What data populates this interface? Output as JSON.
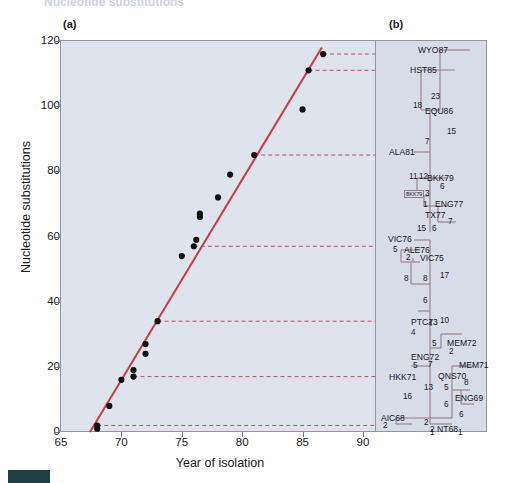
{
  "figure": {
    "running_head": "Nucleotide substitutions",
    "panel_a_tag": "(a)",
    "panel_b_tag": "(b)"
  },
  "chart_data": {
    "type": "scatter",
    "title": "",
    "xlabel": "Year of isolation",
    "ylabel": "Nucleotide substitutions",
    "xlim": [
      65,
      91
    ],
    "ylim": [
      0,
      120
    ],
    "xticks": [
      65,
      70,
      75,
      80,
      85,
      90
    ],
    "yticks": [
      0,
      20,
      40,
      60,
      80,
      100,
      120
    ],
    "grid": false,
    "legend": "none",
    "series": [
      {
        "name": "Influenza isolates",
        "points": [
          {
            "x": 68.0,
            "y": 1
          },
          {
            "x": 68.0,
            "y": 2
          },
          {
            "x": 69.0,
            "y": 8
          },
          {
            "x": 70.0,
            "y": 16
          },
          {
            "x": 71.0,
            "y": 17
          },
          {
            "x": 71.0,
            "y": 19
          },
          {
            "x": 72.0,
            "y": 24
          },
          {
            "x": 72.0,
            "y": 27
          },
          {
            "x": 73.0,
            "y": 34
          },
          {
            "x": 75.0,
            "y": 54
          },
          {
            "x": 76.0,
            "y": 57
          },
          {
            "x": 76.2,
            "y": 59
          },
          {
            "x": 76.5,
            "y": 66
          },
          {
            "x": 76.5,
            "y": 67
          },
          {
            "x": 78.0,
            "y": 72
          },
          {
            "x": 79.0,
            "y": 79
          },
          {
            "x": 81.0,
            "y": 85
          },
          {
            "x": 85.0,
            "y": 99
          },
          {
            "x": 85.5,
            "y": 111
          },
          {
            "x": 86.7,
            "y": 116
          }
        ]
      }
    ],
    "regression_line": {
      "x1": 67.4,
      "y1": 0,
      "x2": 86.6,
      "y2": 118,
      "color": "#c43c46"
    },
    "dashed_links": [
      {
        "y": 116,
        "from_x": 86.7,
        "to_x": 91,
        "label": "WYO87"
      },
      {
        "y": 111,
        "from_x": 85.5,
        "to_x": 91,
        "label": "HST85"
      },
      {
        "y": 85,
        "from_x": 81.0,
        "to_x": 91,
        "label": "ALA81"
      },
      {
        "y": 57,
        "from_x": 76.0,
        "to_x": 91,
        "label": "VIC76"
      },
      {
        "y": 34,
        "from_x": 73.0,
        "to_x": 91,
        "label": "PTC73"
      },
      {
        "y": 17,
        "from_x": 71.0,
        "to_x": 91,
        "label": "HKK71"
      },
      {
        "y": 2,
        "from_x": 68.0,
        "to_x": 91,
        "label": "AIC68"
      }
    ]
  },
  "tree": {
    "taxa": [
      {
        "name": "WYO87",
        "x": 418,
        "y": 45,
        "boxed": false
      },
      {
        "name": "HST85",
        "x": 410,
        "y": 65,
        "boxed": false
      },
      {
        "name": "EQU86",
        "x": 425,
        "y": 106,
        "boxed": false
      },
      {
        "name": "ALA81",
        "x": 389,
        "y": 147,
        "boxed": false
      },
      {
        "name": "BKK79",
        "x": 427,
        "y": 173,
        "boxed": false
      },
      {
        "name": "BKK79",
        "x": 404,
        "y": 190,
        "boxed": true
      },
      {
        "name": "ENG77",
        "x": 435,
        "y": 199,
        "boxed": false
      },
      {
        "name": "TX77",
        "x": 425,
        "y": 210,
        "boxed": false
      },
      {
        "name": "VIC76",
        "x": 388,
        "y": 234,
        "boxed": false
      },
      {
        "name": "ALE76",
        "x": 404,
        "y": 245,
        "boxed": false
      },
      {
        "name": "VIC75",
        "x": 420,
        "y": 253,
        "boxed": false
      },
      {
        "name": "PTC73",
        "x": 411,
        "y": 317,
        "boxed": false
      },
      {
        "name": "MEM72",
        "x": 447,
        "y": 338,
        "boxed": false
      },
      {
        "name": "ENG72",
        "x": 411,
        "y": 352,
        "boxed": false
      },
      {
        "name": "MEM71",
        "x": 459,
        "y": 360,
        "boxed": false
      },
      {
        "name": "HKK71",
        "x": 389,
        "y": 372,
        "boxed": false
      },
      {
        "name": "QNS70",
        "x": 438,
        "y": 371,
        "boxed": false
      },
      {
        "name": "ENG69",
        "x": 455,
        "y": 393,
        "boxed": false
      },
      {
        "name": "AIC68",
        "x": 381,
        "y": 413,
        "boxed": false
      },
      {
        "name": "NT68",
        "x": 437,
        "y": 424,
        "boxed": false
      }
    ],
    "branch_lengths": [
      {
        "value": "23",
        "x": 431,
        "y": 92
      },
      {
        "value": "18",
        "x": 413,
        "y": 101
      },
      {
        "value": "15",
        "x": 447,
        "y": 127
      },
      {
        "value": "7",
        "x": 425,
        "y": 137
      },
      {
        "value": "11",
        "x": 409,
        "y": 172
      },
      {
        "value": "12",
        "x": 419,
        "y": 172
      },
      {
        "value": "6",
        "x": 440,
        "y": 182
      },
      {
        "value": "3",
        "x": 425,
        "y": 189
      },
      {
        "value": "1",
        "x": 423,
        "y": 200
      },
      {
        "value": "15",
        "x": 417,
        "y": 224
      },
      {
        "value": "6",
        "x": 432,
        "y": 224
      },
      {
        "value": "7",
        "x": 448,
        "y": 217
      },
      {
        "value": "5",
        "x": 393,
        "y": 245
      },
      {
        "value": "2",
        "x": 406,
        "y": 253
      },
      {
        "value": "8",
        "x": 404,
        "y": 274
      },
      {
        "value": "8",
        "x": 423,
        "y": 274
      },
      {
        "value": "17",
        "x": 440,
        "y": 271
      },
      {
        "value": "6",
        "x": 423,
        "y": 296
      },
      {
        "value": "4",
        "x": 428,
        "y": 319
      },
      {
        "value": "10",
        "x": 440,
        "y": 316
      },
      {
        "value": "4",
        "x": 411,
        "y": 328
      },
      {
        "value": "5",
        "x": 432,
        "y": 339
      },
      {
        "value": "2",
        "x": 449,
        "y": 347
      },
      {
        "value": "5",
        "x": 413,
        "y": 361
      },
      {
        "value": "7",
        "x": 428,
        "y": 360
      },
      {
        "value": "8",
        "x": 464,
        "y": 378
      },
      {
        "value": "5",
        "x": 444,
        "y": 383
      },
      {
        "value": "13",
        "x": 424,
        "y": 383
      },
      {
        "value": "16",
        "x": 403,
        "y": 392
      },
      {
        "value": "6",
        "x": 444,
        "y": 400
      },
      {
        "value": "6",
        "x": 459,
        "y": 410
      },
      {
        "value": "2",
        "x": 383,
        "y": 421
      },
      {
        "value": "2",
        "x": 424,
        "y": 418
      },
      {
        "value": "2",
        "x": 430,
        "y": 425
      },
      {
        "value": "1",
        "x": 430,
        "y": 428
      },
      {
        "value": "1",
        "x": 458,
        "y": 428
      }
    ]
  },
  "colors": {
    "plot_bg": "#dfe3ec",
    "tree_bg": "#d8dce7",
    "regression": "#c43c46",
    "dash": "#b55560",
    "tree_branch": "#9a7d86",
    "axis": "#6e7380",
    "swatch": "#1d4044"
  }
}
